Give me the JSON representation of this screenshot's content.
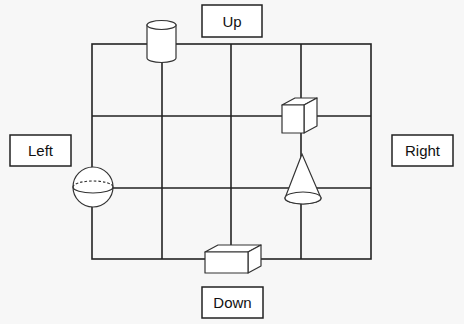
{
  "diagram": {
    "grid": {
      "rows": 3,
      "cols": 4
    },
    "labels": {
      "up": "Up",
      "down": "Down",
      "left": "Left",
      "right": "Right"
    },
    "shapes": [
      {
        "name": "cylinder",
        "position": "top edge, between column 1 and 2"
      },
      {
        "name": "cube",
        "position": "intersection of row line 1 and column line 3"
      },
      {
        "name": "cone",
        "position": "intersection of row line 2 and column line 3"
      },
      {
        "name": "sphere",
        "position": "left edge at row line 2"
      },
      {
        "name": "rectangular-box",
        "position": "bottom edge, center"
      }
    ],
    "colors": {
      "line": "#222222",
      "shape_stroke": "#333333",
      "background": "#f7f7f7",
      "fill": "#ffffff"
    }
  }
}
